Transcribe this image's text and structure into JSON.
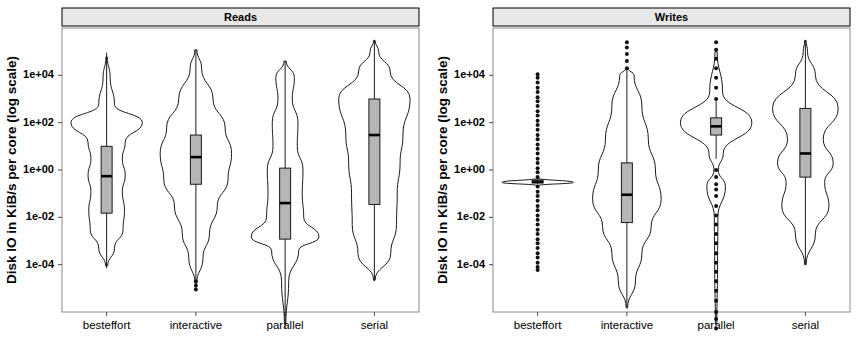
{
  "figure": {
    "width": 862,
    "height": 338,
    "background": "#ffffff"
  },
  "axis": {
    "y_title": "Disk IO in KiB/s per core (log scale)",
    "y_tick_labels": [
      "1e+04",
      "1e+02",
      "1e+00",
      "1e-02",
      "1e-04"
    ],
    "y_tick_values": [
      10000,
      100,
      1,
      0.01,
      0.0001
    ],
    "x_tick_labels": [
      "besteffort",
      "interactive",
      "parallel",
      "serial"
    ]
  },
  "colors": {
    "strip_fill": "#e8e8e8",
    "box_fill": "#b5b5b5",
    "line": "#1a1a1a",
    "axis": "#4d4d4d",
    "panel_border": "#8a8a8a",
    "background": "#ffffff"
  },
  "panels": [
    {
      "id": "reads",
      "title": "Reads"
    },
    {
      "id": "writes",
      "title": "Writes"
    }
  ],
  "chart_data": {
    "type": "violin-boxplot",
    "title": "",
    "xlabel": "",
    "ylabel": "Disk IO in KiB/s per core (log scale)",
    "y_scale": "log10",
    "ylim": [
      1e-06,
      1000000.0
    ],
    "y_ticks": [
      10000.0,
      100.0,
      1.0,
      0.01,
      0.0001
    ],
    "y_tick_labels": [
      "1e+04",
      "1e+02",
      "1e+00",
      "1e-02",
      "1e-04"
    ],
    "categories": [
      "besteffort",
      "interactive",
      "parallel",
      "serial"
    ],
    "grid": false,
    "legend": "none",
    "facets": [
      "Reads",
      "Writes"
    ],
    "panels": [
      {
        "name": "Reads",
        "groups": [
          {
            "category": "besteffort",
            "box": {
              "q1": 0.015,
              "median": 0.55,
              "q3": 10.0,
              "lower_whisker": 7e-05,
              "upper_whisker": 90000.0
            },
            "outliers": [],
            "density": [
              {
                "y": 9e-05,
                "w": 0.03
              },
              {
                "y": 0.0005,
                "w": 0.22
              },
              {
                "y": 0.003,
                "w": 0.46
              },
              {
                "y": 0.02,
                "w": 0.5
              },
              {
                "y": 0.12,
                "w": 0.44
              },
              {
                "y": 0.6,
                "w": 0.52
              },
              {
                "y": 3.0,
                "w": 0.44
              },
              {
                "y": 15.0,
                "w": 0.52
              },
              {
                "y": 100.0,
                "w": 1.0
              },
              {
                "y": 600.0,
                "w": 0.22
              },
              {
                "y": 8000.0,
                "w": 0.1
              },
              {
                "y": 60000.0,
                "w": 0.02
              }
            ]
          },
          {
            "category": "interactive",
            "box": {
              "q1": 0.25,
              "median": 3.5,
              "q3": 30.0,
              "lower_whisker": 2e-05,
              "upper_whisker": 120000.0
            },
            "outliers": [
              2e-05,
              1.3e-05,
              9e-06
            ],
            "density": [
              {
                "y": 1.5e-05,
                "w": 0.02
              },
              {
                "y": 0.0002,
                "w": 0.2
              },
              {
                "y": 0.002,
                "w": 0.38
              },
              {
                "y": 0.03,
                "w": 0.6
              },
              {
                "y": 0.4,
                "w": 0.9
              },
              {
                "y": 5.0,
                "w": 1.0
              },
              {
                "y": 60.0,
                "w": 0.82
              },
              {
                "y": 1000.0,
                "w": 0.48
              },
              {
                "y": 20000.0,
                "w": 0.16
              },
              {
                "y": 120000.0,
                "w": 0.03
              }
            ]
          },
          {
            "category": "parallel",
            "box": {
              "q1": 0.0012,
              "median": 0.04,
              "q3": 1.2,
              "lower_whisker": 2e-07,
              "upper_whisker": 40000.0
            },
            "outliers": [],
            "density": [
              {
                "y": 3e-07,
                "w": 0.02
              },
              {
                "y": 2e-05,
                "w": 0.1
              },
              {
                "y": 0.0004,
                "w": 0.38
              },
              {
                "y": 0.0015,
                "w": 0.95
              },
              {
                "y": 0.01,
                "w": 0.52
              },
              {
                "y": 0.1,
                "w": 0.48
              },
              {
                "y": 1.0,
                "w": 0.5
              },
              {
                "y": 10.0,
                "w": 0.34
              },
              {
                "y": 100.0,
                "w": 0.36
              },
              {
                "y": 1000.0,
                "w": 0.2
              },
              {
                "y": 8000.0,
                "w": 0.26
              },
              {
                "y": 40000.0,
                "w": 0.03
              }
            ]
          },
          {
            "category": "serial",
            "box": {
              "q1": 0.035,
              "median": 30.0,
              "q3": 1000.0,
              "lower_whisker": 2e-05,
              "upper_whisker": 300000.0
            },
            "outliers": [],
            "density": [
              {
                "y": 2.2e-05,
                "w": 0.02
              },
              {
                "y": 0.0003,
                "w": 0.46
              },
              {
                "y": 0.005,
                "w": 0.62
              },
              {
                "y": 0.1,
                "w": 0.64
              },
              {
                "y": 2.0,
                "w": 0.72
              },
              {
                "y": 30.0,
                "w": 0.8
              },
              {
                "y": 1000.0,
                "w": 1.0
              },
              {
                "y": 15000.0,
                "w": 0.44
              },
              {
                "y": 100000.0,
                "w": 0.12
              },
              {
                "y": 300000.0,
                "w": 0.02
              }
            ]
          }
        ]
      },
      {
        "name": "Writes",
        "groups": [
          {
            "category": "besteffort",
            "box": {
              "q1": 0.28,
              "median": 0.32,
              "q3": 0.38,
              "lower_whisker": 0.25,
              "upper_whisker": 0.42
            },
            "outliers": [
              11000.0,
              8000.0,
              5000.0,
              3000.0,
              2000.0,
              1200.0,
              800.0,
              500.0,
              300.0,
              200.0,
              120.0,
              80.0,
              50.0,
              30.0,
              20.0,
              12.0,
              8.0,
              5.0,
              3.0,
              2.0,
              1.2,
              0.8,
              0.5,
              0.2,
              0.12,
              0.08,
              0.05,
              0.03,
              0.02,
              0.012,
              0.008,
              0.005,
              0.003,
              0.002,
              0.0012,
              0.0008,
              0.0005,
              0.0003,
              0.0002,
              0.00012,
              8e-05,
              6e-05
            ],
            "density": [
              {
                "y": 0.22,
                "w": 0.02
              },
              {
                "y": 0.3,
                "w": 1.0
              },
              {
                "y": 0.45,
                "w": 0.02
              }
            ]
          },
          {
            "category": "interactive",
            "box": {
              "q1": 0.006,
              "median": 0.09,
              "q3": 2.0,
              "lower_whisker": 1.5e-06,
              "upper_whisker": 20000.0
            },
            "outliers": [
              20000.0,
              40000.0,
              80000.0,
              150000.0,
              250000.0
            ],
            "density": [
              {
                "y": 1.5e-06,
                "w": 0.02
              },
              {
                "y": 2e-05,
                "w": 0.24
              },
              {
                "y": 0.0003,
                "w": 0.42
              },
              {
                "y": 0.004,
                "w": 0.68
              },
              {
                "y": 0.06,
                "w": 0.96
              },
              {
                "y": 1.0,
                "w": 0.8
              },
              {
                "y": 20.0,
                "w": 0.6
              },
              {
                "y": 500.0,
                "w": 0.42
              },
              {
                "y": 10000.0,
                "w": 0.2
              },
              {
                "y": 20000.0,
                "w": 0.03
              }
            ]
          },
          {
            "category": "parallel",
            "box": {
              "q1": 30.0,
              "median": 70.0,
              "q3": 160.0,
              "lower_whisker": 3.0,
              "upper_whisker": 800.0
            },
            "outliers": [
              2e-07,
              5e-07,
              1e-06,
              3e-06,
              8e-06,
              2e-05,
              5e-05,
              0.00012,
              0.0003,
              0.0008,
              0.002,
              0.005,
              0.012,
              0.03,
              0.08,
              0.15,
              0.25,
              0.5,
              1.0,
              1000.0,
              3000.0,
              8000.0,
              20000.0,
              50000.0,
              120000.0,
              250000.0
            ],
            "density": [
              {
                "y": 3e-07,
                "w": 0.02
              },
              {
                "y": 0.0001,
                "w": 0.04
              },
              {
                "y": 0.01,
                "w": 0.05
              },
              {
                "y": 0.2,
                "w": 0.26
              },
              {
                "y": 1.0,
                "w": 0.06
              },
              {
                "y": 5.0,
                "w": 0.2
              },
              {
                "y": 100.0,
                "w": 1.0
              },
              {
                "y": 2000.0,
                "w": 0.18
              },
              {
                "y": 100000.0,
                "w": 0.03
              }
            ]
          },
          {
            "category": "serial",
            "box": {
              "q1": 0.5,
              "median": 5.0,
              "q3": 400.0,
              "lower_whisker": 0.0001,
              "upper_whisker": 300000.0
            },
            "outliers": [],
            "density": [
              {
                "y": 0.0001,
                "w": 0.02
              },
              {
                "y": 0.002,
                "w": 0.28
              },
              {
                "y": 0.03,
                "w": 0.66
              },
              {
                "y": 0.3,
                "w": 0.54
              },
              {
                "y": 2.0,
                "w": 0.78
              },
              {
                "y": 20.0,
                "w": 0.5
              },
              {
                "y": 400.0,
                "w": 0.92
              },
              {
                "y": 10000.0,
                "w": 0.28
              },
              {
                "y": 100000.0,
                "w": 0.06
              },
              {
                "y": 300000.0,
                "w": 0.02
              }
            ]
          }
        ]
      }
    ]
  }
}
